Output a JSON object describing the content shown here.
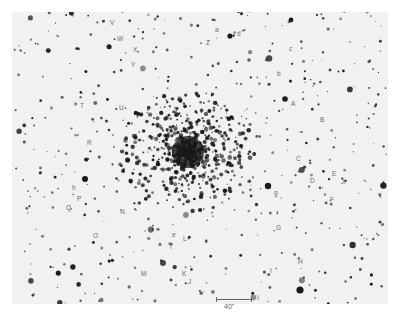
{
  "image": {
    "description": "Photographic finding chart of a globular star cluster with labeled field stars",
    "background": "#f1f1ef",
    "star_color": "#1a1a1a",
    "label_color": "#6a6a6a"
  },
  "scale_bar": {
    "label": "40\""
  },
  "labels": [
    {
      "id": "V",
      "text": "V",
      "x": 110,
      "y": 20
    },
    {
      "id": "W",
      "text": "W",
      "x": 117,
      "y": 36
    },
    {
      "id": "X",
      "text": "X",
      "x": 133,
      "y": 47
    },
    {
      "id": "Y",
      "text": "Y",
      "x": 131,
      "y": 62
    },
    {
      "id": "T",
      "text": "T",
      "x": 80,
      "y": 103
    },
    {
      "id": "U",
      "text": "U",
      "x": 119,
      "y": 105
    },
    {
      "id": "a",
      "text": "a",
      "x": 215,
      "y": 27
    },
    {
      "id": "d",
      "text": "d",
      "x": 237,
      "y": 31
    },
    {
      "id": "Z",
      "text": "Z",
      "x": 206,
      "y": 40
    },
    {
      "id": "c",
      "text": "c",
      "x": 289,
      "y": 46
    },
    {
      "id": "b",
      "text": "b",
      "x": 277,
      "y": 71
    },
    {
      "id": "A",
      "text": "A",
      "x": 291,
      "y": 101
    },
    {
      "id": "B",
      "text": "B",
      "x": 320,
      "y": 117
    },
    {
      "id": "R",
      "text": "R",
      "x": 87,
      "y": 140
    },
    {
      "id": "C",
      "text": "C",
      "x": 296,
      "y": 156
    },
    {
      "id": "E",
      "text": "E",
      "x": 332,
      "y": 171
    },
    {
      "id": "D",
      "text": "D",
      "x": 310,
      "y": 178
    },
    {
      "id": "J2",
      "text": "J",
      "x": 341,
      "y": 179
    },
    {
      "id": "g",
      "text": "g",
      "x": 274,
      "y": 190
    },
    {
      "id": "F",
      "text": "F",
      "x": 330,
      "y": 197
    },
    {
      "id": "h",
      "text": "h",
      "x": 72,
      "y": 185
    },
    {
      "id": "P",
      "text": "P",
      "x": 77,
      "y": 196
    },
    {
      "id": "Q",
      "text": "Q",
      "x": 66,
      "y": 205
    },
    {
      "id": "N",
      "text": "N",
      "x": 120,
      "y": 209
    },
    {
      "id": "O",
      "text": "O",
      "x": 93,
      "y": 233
    },
    {
      "id": "e",
      "text": "e",
      "x": 172,
      "y": 232
    },
    {
      "id": "L",
      "text": "L",
      "x": 183,
      "y": 236
    },
    {
      "id": "f",
      "text": "f",
      "x": 170,
      "y": 244
    },
    {
      "id": "G",
      "text": "G",
      "x": 276,
      "y": 225
    },
    {
      "id": "M",
      "text": "M",
      "x": 141,
      "y": 271
    },
    {
      "id": "K",
      "text": "K",
      "x": 182,
      "y": 271
    },
    {
      "id": "J",
      "text": "J",
      "x": 188,
      "y": 279
    },
    {
      "id": "H",
      "text": "H",
      "x": 298,
      "y": 259
    },
    {
      "id": "I",
      "text": "I",
      "x": 270,
      "y": 268
    },
    {
      "id": "I2",
      "text": "I",
      "x": 257,
      "y": 295
    }
  ]
}
